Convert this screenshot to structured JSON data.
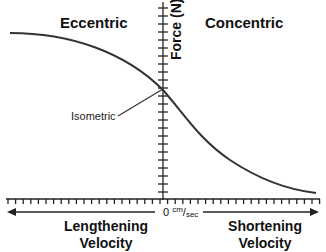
{
  "chart_data": {
    "type": "line",
    "title": "",
    "xlabel_left": "Lengthening Velocity",
    "xlabel_right": "Shortening Velocity",
    "ylabel": "Force (N)",
    "x_origin_label": {
      "value": "0",
      "unit_num": "cm",
      "unit_den": "sec"
    },
    "regions": [
      "Eccentric",
      "Concentric"
    ],
    "annotations": [
      {
        "text": "Isometric",
        "points_to": "curve at x = 0"
      }
    ],
    "grid": false,
    "legend": null,
    "ticks_labeled": false,
    "series": [
      {
        "name": "Force-Velocity relationship",
        "description": "Force plateaus high during lengthening (eccentric), crosses y-axis at isometric force, and decays hyperbolically toward zero with increasing shortening (concentric) velocity",
        "x_normalized": [
          -1.0,
          -0.6,
          -0.3,
          0.0,
          0.1,
          0.35,
          0.6,
          1.0
        ],
        "y_normalized": [
          0.87,
          0.8,
          0.69,
          0.58,
          0.47,
          0.25,
          0.11,
          0.03
        ]
      }
    ],
    "color": "#333333"
  },
  "labels": {
    "eccentric": "Eccentric",
    "concentric": "Concentric",
    "force": "Force (N)",
    "isometric": "Isometric",
    "zero": "0",
    "unit_num": "cm",
    "unit_den": "sec",
    "lengthening_line1": "Lengthening",
    "lengthening_line2": "Velocity",
    "shortening_line1": "Shortening",
    "shortening_line2": "Velocity"
  }
}
